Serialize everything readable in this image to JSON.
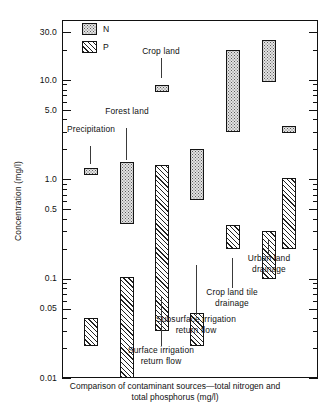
{
  "figure": {
    "caption_line1": "Comparison of contaminant sources—total nitrogen and",
    "caption_line2": "total phosphorus   (mg/l)",
    "y_axis_title": "Concentration   (mg/l)"
  },
  "legend": {
    "position": "top-left-inside",
    "entries": [
      {
        "key": "N",
        "label": "N",
        "pattern": "stipple",
        "name": "total nitrogen"
      },
      {
        "key": "P",
        "label": "P",
        "pattern": "diagonal-hatch",
        "name": "total phosphorus"
      }
    ]
  },
  "annotations": [
    {
      "id": "precipitation",
      "lines": [
        "Precipitation"
      ]
    },
    {
      "id": "forest-land",
      "lines": [
        "Forest land"
      ]
    },
    {
      "id": "crop-land",
      "lines": [
        "Crop land"
      ]
    },
    {
      "id": "surface-irrigation",
      "lines": [
        "Surface irrigation",
        "return flow"
      ]
    },
    {
      "id": "subsurface-irrigation",
      "lines": [
        "Subsurface irrigation",
        "return flow"
      ]
    },
    {
      "id": "crop-land-tile",
      "lines": [
        "Crop land tile",
        "drainage"
      ]
    },
    {
      "id": "urban-land",
      "lines": [
        "Urban land",
        "drainage"
      ]
    }
  ],
  "chart_data": {
    "type": "bar",
    "title": "Comparison of contaminant sources—total nitrogen and total phosphorus   (mg/l)",
    "xlabel": "",
    "ylabel": "Concentration   (mg/l)",
    "yscale": "log",
    "ylim": [
      0.01,
      40.0
    ],
    "grid": false,
    "bar_style": "floating range bars (low-high)",
    "units": "mg/l",
    "y_major_ticks": [
      30.0,
      10.0,
      5.0,
      1.0,
      0.5,
      0.1,
      0.05,
      0.01
    ],
    "y_tick_labels": [
      "30.0",
      "10.0",
      "5.0",
      "1.0",
      "0.5",
      "0.1",
      "0.05",
      "0.01"
    ],
    "y_minor_ticks": [
      0.02,
      0.03,
      0.04,
      0.06,
      0.07,
      0.08,
      0.09,
      0.2,
      0.3,
      0.4,
      0.6,
      0.7,
      0.8,
      0.9,
      2.0,
      3.0,
      4.0,
      6.0,
      7.0,
      8.0,
      9.0,
      20.0
    ],
    "categories": [
      "Precipitation",
      "Forest land",
      "Crop land",
      "Surface irrigation return flow",
      "Subsurface irrigation return flow",
      "Crop land tile drainage",
      "Urban land drainage"
    ],
    "series": [
      {
        "name": "N",
        "label": "N",
        "pattern": "stipple",
        "ranges": [
          {
            "category": "Precipitation",
            "low": 1.1,
            "high": 1.3
          },
          {
            "category": "Forest land",
            "low": 0.35,
            "high": 1.5
          },
          {
            "category": "Crop land",
            "low": 7.8,
            "high": 8.8
          },
          {
            "category": "Surface irrigation return flow",
            "low": 0.62,
            "high": 2.0
          },
          {
            "category": "Subsurface irrigation return flow",
            "low": 3.0,
            "high": 20.0
          },
          {
            "category": "Crop land tile drainage",
            "low": 9.5,
            "high": 25.0
          },
          {
            "category": "Urban land drainage",
            "low": 3.0,
            "high": 3.4
          }
        ]
      },
      {
        "name": "P",
        "label": "P",
        "pattern": "diagonal-hatch",
        "ranges": [
          {
            "category": "Precipitation",
            "low": 0.021,
            "high": 0.04
          },
          {
            "category": "Forest land",
            "low": 0.01,
            "high": 0.105
          },
          {
            "category": "Crop land",
            "low": 0.03,
            "high": 1.4
          },
          {
            "category": "Surface irrigation return flow",
            "low": 0.021,
            "high": 0.045
          },
          {
            "category": "Subsurface irrigation return flow",
            "low": 0.2,
            "high": 0.35
          },
          {
            "category": "Crop land tile drainage",
            "low": 0.1,
            "high": 0.3
          },
          {
            "category": "Urban land drainage",
            "low": 0.2,
            "high": 1.02
          }
        ]
      }
    ]
  }
}
